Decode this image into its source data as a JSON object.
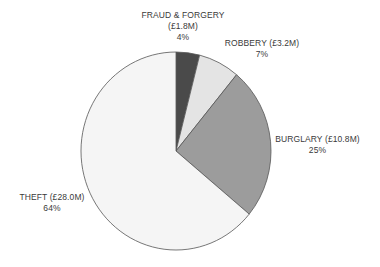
{
  "chart_data": {
    "type": "pie",
    "title": "",
    "start_angle_deg": 0,
    "direction": "clockwise",
    "slices": [
      {
        "name": "FRAUD & FORGERY",
        "value_label": "(£1.8M)",
        "value": 1.8,
        "percent": 4,
        "percent_label": "4%",
        "color": "#4a4a4a"
      },
      {
        "name": "ROBBERY",
        "value_label": "(£3.2M)",
        "value": 3.2,
        "percent": 7,
        "percent_label": "7%",
        "color": "#e4e4e4"
      },
      {
        "name": "BURGLARY",
        "value_label": "(£10.8M)",
        "value": 10.8,
        "percent": 25,
        "percent_label": "25%",
        "color": "#9c9c9c"
      },
      {
        "name": "THEFT",
        "value_label": "(£28.0M)",
        "value": 28.0,
        "percent": 64,
        "percent_label": "64%",
        "color": "#f5f5f5"
      }
    ],
    "legend": "none",
    "stroke_color": "#555555"
  },
  "labels": {
    "fraud": {
      "line1": "FRAUD & FORGERY",
      "line2": "(£1.8M)",
      "line3": "4%"
    },
    "robbery": {
      "line1": "ROBBERY (£3.2M)",
      "line2": "7%"
    },
    "burglary": {
      "line1": "BURGLARY (£10.8M)",
      "line2": "25%"
    },
    "theft": {
      "line1": "THEFT (£28.0M)",
      "line2": "64%"
    }
  }
}
